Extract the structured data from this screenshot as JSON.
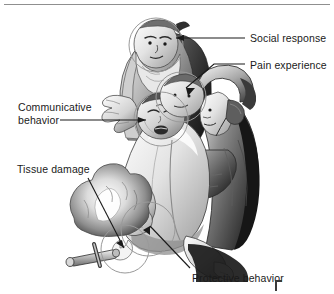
{
  "figure": {
    "background_color": "#ffffff",
    "ink_color": "#1a1a1a",
    "rule_color": "#8f8f8f",
    "highlight_circle_color": "#9a9a9a"
  },
  "labels": {
    "social_response": "Social response",
    "pain_experience": "Pain experience",
    "communicative_behavior_line1": "Communicative",
    "communicative_behavior_line2": "behavior",
    "tissue_damage": "Tissue damage",
    "protective_behavior": "Protective behavior"
  },
  "annotations": [
    {
      "name": "social-response",
      "label": "Social response",
      "target": "face of elderly bearded man",
      "leader": "horizontal line with arrowhead pointing left"
    },
    {
      "name": "pain-experience",
      "label": "Pain experience",
      "target": "head of wounded man",
      "leader": "diagonal line with arrowhead pointing down-left"
    },
    {
      "name": "communicative-behavior",
      "label": "Communicative behavior",
      "target": "grimacing face of wounded man",
      "leader": "horizontal line with arrowhead pointing right"
    },
    {
      "name": "tissue-damage",
      "label": "Tissue damage",
      "target": "flame and burned hand near the fire",
      "leader": "diagonal line with arrowhead pointing down-right"
    },
    {
      "name": "protective-behavior",
      "label": "Protective behavior",
      "target": "withdrawn hand held to the body",
      "leader": "diagonal line with arrowhead pointing up-left"
    }
  ],
  "highlight_circles": [
    {
      "name": "circle-social-response",
      "cx": 156,
      "cy": 45,
      "r": 27
    },
    {
      "name": "circle-pain-experience",
      "cx": 181,
      "cy": 97,
      "r": 25
    },
    {
      "name": "circle-communicative-behavior",
      "cx": 161,
      "cy": 119,
      "r": 27
    },
    {
      "name": "circle-tissue-damage",
      "cx": 125,
      "cy": 249,
      "r": 24
    },
    {
      "name": "circle-protective-behavior",
      "cx": 148,
      "cy": 229,
      "r": 27
    }
  ]
}
